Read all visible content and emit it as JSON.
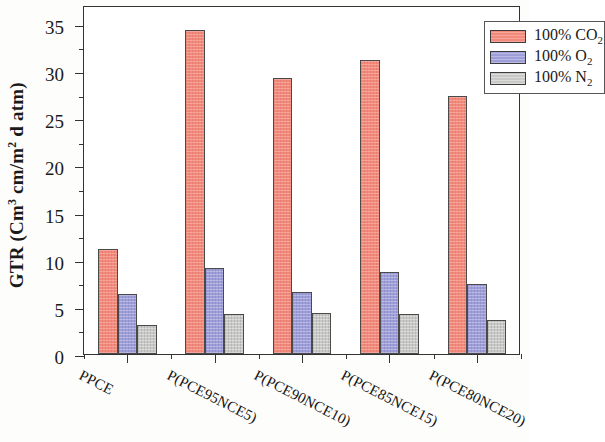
{
  "chart_data": {
    "type": "bar",
    "title": "",
    "xlabel": "",
    "ylabel": "GTR (Cm3 cm/m2 d atm)",
    "ylabel_parts": {
      "prefix": "GTR (Cm",
      "sup1": "3",
      "middle": " cm/m",
      "sup2": "2",
      "suffix": " d atm)"
    },
    "categories": [
      "PPCE",
      "P(PCE95NCE5)",
      "P(PCE90NCE10)",
      "P(PCE85NCE15)",
      "P(PCE80NCE20)"
    ],
    "series": [
      {
        "name": "100% CO2",
        "label_prefix": "100% CO",
        "label_sub": "2",
        "color": "#f2897a",
        "values": [
          11.1,
          34.3,
          29.3,
          31.2,
          27.4
        ]
      },
      {
        "name": "100% O2",
        "label_prefix": "100% O",
        "label_sub": "2",
        "color": "#9e9ed9",
        "values": [
          6.4,
          9.1,
          6.6,
          8.7,
          7.4
        ]
      },
      {
        "name": "100% N2",
        "label_prefix": "100% N",
        "label_sub": "2",
        "color": "#c9c9c7",
        "values": [
          3.1,
          4.2,
          4.3,
          4.2,
          3.6
        ]
      }
    ],
    "ylim": [
      0,
      37
    ],
    "yticks": [
      0,
      5,
      10,
      15,
      20,
      25,
      30,
      35
    ],
    "yticks_minor": [
      2.5,
      7.5,
      12.5,
      17.5,
      22.5,
      27.5,
      32.5
    ],
    "grid": false,
    "legend_position": "top-right",
    "axis_color": "#333333"
  }
}
